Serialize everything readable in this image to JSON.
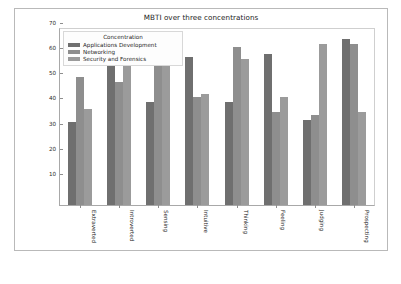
{
  "chart_data": {
    "type": "bar",
    "title": "MBTI over three concentrations",
    "xlabel": "",
    "ylabel": "",
    "ylim": [
      0,
      70
    ],
    "yticks": [
      10,
      20,
      30,
      40,
      50,
      60,
      70
    ],
    "grid": false,
    "legend_position": "upper-left-inside",
    "legend_title": "Concentration",
    "categories": [
      "Extraverted",
      "Introverted",
      "Sensing",
      "Intuitive",
      "Thinking",
      "Feeling",
      "Judging",
      "Prospecting"
    ],
    "series": [
      {
        "name": "Applications Development",
        "color": "#6f6f6f",
        "values": [
          33,
          58,
          41,
          59,
          41,
          60,
          34,
          66
        ]
      },
      {
        "name": "Networking",
        "color": "#8e8e8e",
        "values": [
          51,
          49,
          58,
          43,
          63,
          37,
          36,
          64
        ]
      },
      {
        "name": "Security and Forensics",
        "color": "#9b9b9b",
        "values": [
          38,
          58,
          57,
          44,
          58,
          43,
          64,
          37
        ]
      }
    ]
  }
}
